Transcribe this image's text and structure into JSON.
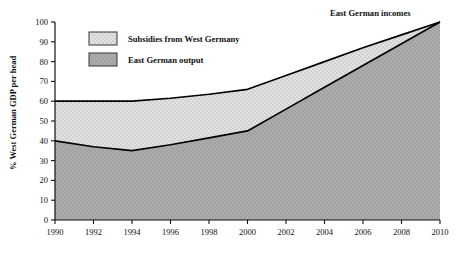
{
  "chart_data": {
    "type": "area",
    "title": "",
    "subtitle": "",
    "xlabel": "",
    "ylabel": "% West German GDP per head",
    "xlim": [
      1990,
      2010
    ],
    "ylim": [
      0,
      100
    ],
    "grid": false,
    "legend_position": "top-left",
    "x": [
      1990,
      1992,
      1994,
      1996,
      1998,
      2000,
      2002,
      2004,
      2006,
      2008,
      2010
    ],
    "xtick_labels": [
      "1990",
      "1992",
      "1994",
      "1996",
      "1998",
      "2000",
      "2002",
      "2004",
      "2006",
      "2008",
      "2010"
    ],
    "ytick_labels": [
      "0",
      "10",
      "20",
      "30",
      "40",
      "50",
      "60",
      "70",
      "80",
      "90",
      "100"
    ],
    "ytick_values": [
      0,
      10,
      20,
      30,
      40,
      50,
      60,
      70,
      80,
      90,
      100
    ],
    "series": [
      {
        "name": "East German incomes",
        "role": "upper-boundary",
        "values": [
          60,
          60,
          60,
          61.5,
          63.5,
          66,
          73,
          80,
          87,
          93.5,
          100
        ]
      },
      {
        "name": "East German output",
        "role": "lower-boundary",
        "values": [
          40,
          37,
          35,
          38,
          41.5,
          45,
          56,
          67,
          78,
          89,
          100
        ]
      }
    ],
    "bands": [
      {
        "name": "Subsidies from West Germany",
        "between": [
          "East German output",
          "East German incomes"
        ],
        "fill": "#dedede"
      },
      {
        "name": "East German output",
        "between": [
          "baseline",
          "East German output"
        ],
        "fill": "#a9a9a9"
      }
    ],
    "annotations": [
      {
        "text": "East German incomes",
        "x": 2008,
        "y": 104
      }
    ],
    "legend": [
      {
        "label": "Subsidies from West Germany",
        "swatch": "#dedede"
      },
      {
        "label": "East German output",
        "swatch": "#a9a9a9"
      }
    ],
    "colors": {
      "axis": "#111111",
      "line": "#000000",
      "subsidies_fill": "#dedede",
      "output_fill": "#a9a9a9",
      "background": "#ffffff"
    }
  }
}
